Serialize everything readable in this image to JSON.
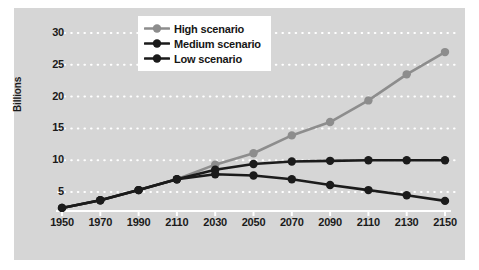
{
  "chart_data": {
    "type": "line",
    "title": "",
    "subtitle": "",
    "xlabel": "",
    "ylabel": "Billions",
    "categories": [
      "1950",
      "1970",
      "1990",
      "2110",
      "2030",
      "2050",
      "2070",
      "2090",
      "2110",
      "2130",
      "2150"
    ],
    "yticks": [
      5,
      10,
      15,
      20,
      25,
      30
    ],
    "ylim": [
      0,
      31
    ],
    "grid": "horizontal-dotted-white",
    "legend_position": "top-center",
    "series": [
      {
        "name": "High scenario",
        "color": "#8d8d8d",
        "values": [
          2.5,
          3.7,
          5.3,
          7.0,
          9.3,
          11.1,
          13.9,
          16.0,
          19.4,
          23.5,
          27.0
        ]
      },
      {
        "name": "Medium scenario",
        "color": "#1b1b1b",
        "values": [
          2.5,
          3.7,
          5.3,
          7.0,
          8.5,
          9.4,
          9.8,
          9.9,
          10.0,
          10.0,
          10.0
        ]
      },
      {
        "name": "Low scenario",
        "color": "#1b1b1b",
        "values": [
          2.5,
          3.7,
          5.3,
          7.0,
          7.8,
          7.6,
          7.0,
          6.1,
          5.3,
          4.5,
          3.6
        ]
      }
    ]
  },
  "legend": {
    "items": [
      {
        "label": "High scenario",
        "color": "#8d8d8d"
      },
      {
        "label": "Medium scenario",
        "color": "#1b1b1b"
      },
      {
        "label": "Low scenario",
        "color": "#1b1b1b"
      }
    ]
  },
  "axes": {
    "y_title": "Billions"
  },
  "colors": {
    "panel_background": "#d6d6d6",
    "gridline": "#ffffff",
    "axis_line": "#ffffff",
    "tick_text": "#1b1b1b",
    "high": "#8d8d8d",
    "medium": "#1b1b1b",
    "low": "#1b1b1b"
  }
}
